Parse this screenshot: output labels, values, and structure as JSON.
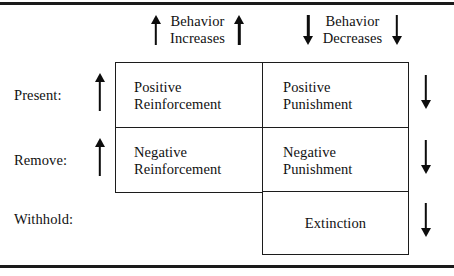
{
  "figure": {
    "rules": {
      "top": true,
      "bottom": true
    },
    "accent_color": "#1a1a1a",
    "text_color": "#111111",
    "background": "#ffffff"
  },
  "column_headers": [
    {
      "id": "behavior-increases",
      "label": "Behavior\nIncreases",
      "arrow_left": "arrow-up-icon",
      "arrow_right": "arrow-up-icon",
      "direction": "up"
    },
    {
      "id": "behavior-decreases",
      "label": "Behavior\nDecreases",
      "arrow_left": "arrow-down-icon",
      "arrow_right": "arrow-down-icon",
      "direction": "down"
    }
  ],
  "row_headers": [
    {
      "id": "present",
      "label": "Present:",
      "arrow": "arrow-up-icon",
      "direction": "up"
    },
    {
      "id": "remove",
      "label": "Remove:",
      "arrow": "arrow-up-icon",
      "direction": "up"
    },
    {
      "id": "withhold",
      "label": "Withhold:",
      "arrow": null,
      "direction": null
    }
  ],
  "right_rail_arrows": [
    {
      "id": "rail-1",
      "icon": "arrow-down-icon",
      "direction": "down"
    },
    {
      "id": "rail-2",
      "icon": "arrow-down-icon",
      "direction": "down"
    },
    {
      "id": "rail-3",
      "icon": "arrow-down-icon",
      "direction": "down"
    }
  ],
  "cells": {
    "positive_reinforcement": "Positive\nReinforcement",
    "positive_punishment": "Positive\nPunishment",
    "negative_reinforcement": "Negative\nReinforcement",
    "negative_punishment": "Negative\nPunishment",
    "extinction": "Extinction"
  }
}
